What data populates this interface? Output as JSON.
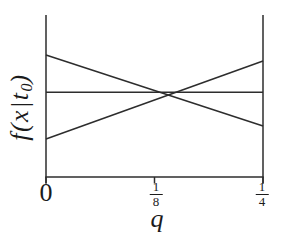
{
  "figure": {
    "background": "#ffffff",
    "line_color": "#2d2d2d",
    "text_color": "#1b1b1b"
  },
  "axes": {
    "x_label": "q",
    "y_label": {
      "pre": "f(x|t",
      "sub": "0",
      "post": ")"
    },
    "x_ticks": [
      {
        "type": "plain",
        "label": "0",
        "value": 0
      },
      {
        "type": "fraction",
        "num": "1",
        "den": "8",
        "value": 0.125
      },
      {
        "type": "fraction",
        "num": "1",
        "den": "4",
        "value": 0.25
      }
    ]
  },
  "chart_data": {
    "type": "line",
    "title": "",
    "xlabel": "q",
    "ylabel": "f(x|t_0)",
    "x_range": [
      0,
      0.25
    ],
    "x_tick_labels": [
      "0",
      "1/8",
      "1/4"
    ],
    "y_axis": "no ticks or numeric scale (density in arbitrary units)",
    "y_units": "fraction of plot height above x-axis",
    "grid": false,
    "legend": false,
    "series": [
      {
        "name": "decreasing line",
        "x": [
          0,
          0.25
        ],
        "y": [
          0.753,
          0.315
        ]
      },
      {
        "name": "horizontal line",
        "x": [
          0,
          0.25
        ],
        "y": [
          0.523,
          0.523
        ]
      },
      {
        "name": "increasing line",
        "x": [
          0,
          0.25
        ],
        "y": [
          0.235,
          0.716
        ]
      }
    ]
  }
}
